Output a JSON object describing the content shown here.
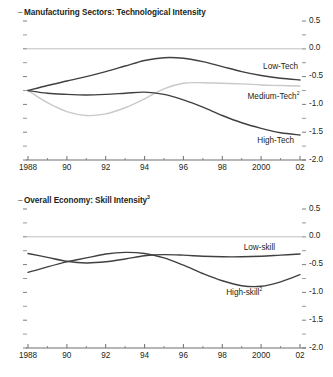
{
  "figure": {
    "background_color": "#ffffff",
    "text_color": "#231f20",
    "axis_color": "#6d6e71",
    "zero_line_color": "#bcbec0"
  },
  "chart_data": [
    {
      "id": "manufacturing",
      "type": "line",
      "title": "Manufacturing Sectors: Technological Intensity",
      "title_prefix_dash": "–",
      "xlabel": "",
      "ylabel": "",
      "grid": false,
      "legend_position": "inline-right",
      "axis_side": "right",
      "x": [
        1988,
        1989,
        1990,
        1991,
        1992,
        1993,
        1994,
        1995,
        1996,
        1997,
        1998,
        1999,
        2000,
        2001,
        2002
      ],
      "xtick_values": [
        1988,
        1990,
        1992,
        1994,
        1996,
        1998,
        2000,
        2002
      ],
      "xtick_labels": [
        "1988",
        "90",
        "92",
        "94",
        "96",
        "98",
        "2000",
        "02"
      ],
      "xlim": [
        1988,
        2002
      ],
      "ytick_values": [
        0.5,
        0.0,
        -0.5,
        -1.0,
        -1.5,
        -2.0
      ],
      "ytick_labels": [
        "0.5",
        "0.0",
        "-0.5",
        "-1.0",
        "-1.5",
        "-2.0"
      ],
      "ylim": [
        -2.0,
        0.5
      ],
      "zero_line": 0.0,
      "series": [
        {
          "name": "Low-Tech",
          "label": "Low-Tech",
          "color": "#404040",
          "width": 1.4,
          "values": [
            -0.75,
            -0.66,
            -0.58,
            -0.5,
            -0.41,
            -0.31,
            -0.21,
            -0.16,
            -0.17,
            -0.23,
            -0.32,
            -0.41,
            -0.48,
            -0.53,
            -0.56
          ],
          "label_x": 2000.1,
          "label_y": -0.33
        },
        {
          "name": "Medium-Tech",
          "label": "Medium-Tech",
          "label_superscript": "2",
          "color": "#c8c9ca",
          "width": 1.4,
          "values": [
            -0.75,
            -0.97,
            -1.13,
            -1.2,
            -1.17,
            -1.06,
            -0.9,
            -0.72,
            -0.62,
            -0.61,
            -0.62,
            -0.63,
            -0.65,
            -0.66,
            -0.67
          ],
          "label_x": 1999.3,
          "label_y": -0.87
        },
        {
          "name": "High-Tech",
          "label": "High-Tech",
          "color": "#404040",
          "width": 1.4,
          "values": [
            -0.75,
            -0.8,
            -0.82,
            -0.83,
            -0.82,
            -0.8,
            -0.78,
            -0.82,
            -0.92,
            -1.05,
            -1.2,
            -1.33,
            -1.43,
            -1.51,
            -1.55
          ],
          "label_x": 1999.8,
          "label_y": -1.66
        }
      ]
    },
    {
      "id": "overall-economy",
      "type": "line",
      "title": "Overall Economy: Skill Intensity",
      "title_superscript": "3",
      "title_prefix_dash": "–",
      "xlabel": "",
      "ylabel": "",
      "grid": false,
      "legend_position": "inline-right",
      "axis_side": "right",
      "x": [
        1988,
        1989,
        1990,
        1991,
        1992,
        1993,
        1994,
        1995,
        1996,
        1997,
        1998,
        1999,
        2000,
        2001,
        2002
      ],
      "xtick_values": [
        1988,
        1990,
        1992,
        1994,
        1996,
        1998,
        2000,
        2002
      ],
      "xtick_labels": [
        "1988",
        "90",
        "92",
        "94",
        "96",
        "98",
        "2000",
        "02"
      ],
      "xlim": [
        1988,
        2002
      ],
      "ytick_values": [
        0.5,
        0.0,
        -0.5,
        -1.0,
        -1.5,
        -2.0
      ],
      "ytick_labels": [
        "0.5",
        "0.0",
        "-0.5",
        "-1.0",
        "-1.5",
        "-2.0"
      ],
      "ylim": [
        -2.0,
        0.5
      ],
      "zero_line": 0.0,
      "series": [
        {
          "name": "Low-skill",
          "label": "Low-skill",
          "color": "#404040",
          "width": 1.4,
          "values": [
            -0.3,
            -0.37,
            -0.44,
            -0.47,
            -0.45,
            -0.4,
            -0.34,
            -0.32,
            -0.33,
            -0.35,
            -0.36,
            -0.36,
            -0.35,
            -0.33,
            -0.31
          ],
          "label_x": 1999.1,
          "label_y": -0.21
        },
        {
          "name": "High-skill",
          "label": "High-skill",
          "label_superscript": "2",
          "color": "#404040",
          "width": 1.4,
          "values": [
            -0.64,
            -0.54,
            -0.45,
            -0.38,
            -0.31,
            -0.28,
            -0.3,
            -0.38,
            -0.51,
            -0.66,
            -0.79,
            -0.88,
            -0.89,
            -0.81,
            -0.68
          ],
          "label_x": 1998.2,
          "label_y": -1.02
        }
      ]
    }
  ]
}
